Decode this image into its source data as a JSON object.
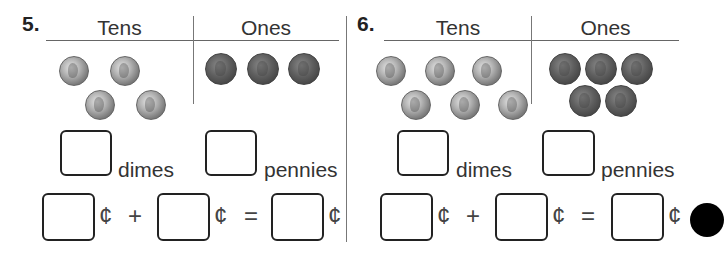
{
  "problems": [
    {
      "number": "5.",
      "tens_header": "Tens",
      "ones_header": "Ones",
      "dimes_count_shown": 4,
      "pennies_count_shown": 3,
      "dimes_label": "dimes",
      "pennies_label": "pennies",
      "dimes_answer": "",
      "pennies_answer": "",
      "equation": {
        "cent_symbol": "¢",
        "plus": "+",
        "equals": "=",
        "term1": "",
        "term2": "",
        "total": ""
      }
    },
    {
      "number": "6.",
      "tens_header": "Tens",
      "ones_header": "Ones",
      "dimes_count_shown": 6,
      "pennies_count_shown": 5,
      "dimes_label": "dimes",
      "pennies_label": "pennies",
      "dimes_answer": "",
      "pennies_answer": "",
      "equation": {
        "cent_symbol": "¢",
        "plus": "+",
        "equals": "=",
        "term1": "",
        "term2": "",
        "total": ""
      }
    }
  ],
  "icons": {
    "dime": "dime-coin-icon",
    "penny": "penny-coin-icon",
    "bullet": "black-circle-marker"
  }
}
